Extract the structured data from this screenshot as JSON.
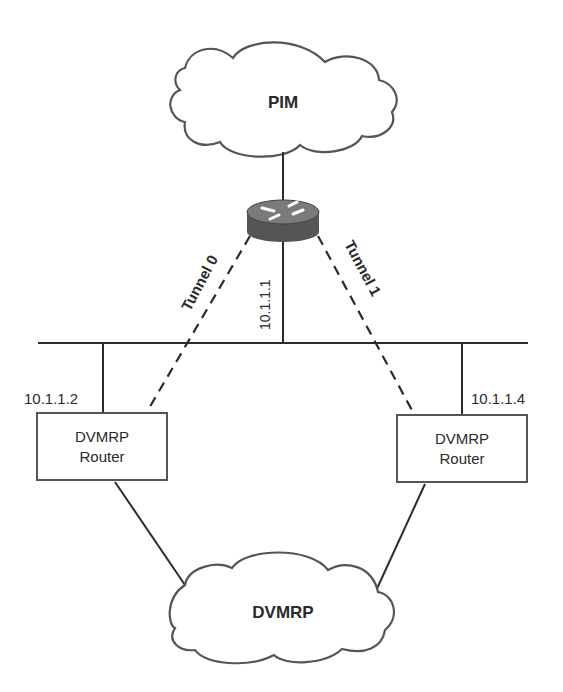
{
  "diagram": {
    "clouds": {
      "top": {
        "label": "PIM"
      },
      "bottom": {
        "label": "DVMRP"
      }
    },
    "central_router": {
      "icon": "router-icon",
      "ip": "10.1.1.1"
    },
    "tunnels": {
      "left": {
        "label": "Tunnel 0"
      },
      "right": {
        "label": "Tunnel 1"
      }
    },
    "routers": {
      "left": {
        "line1": "DVMRP",
        "line2": "Router",
        "ip": "10.1.1.2"
      },
      "right": {
        "line1": "DVMRP",
        "line2": "Router",
        "ip": "10.1.1.4"
      }
    },
    "colors": {
      "stroke": "#2b2b2b",
      "router_body": "#5a5a5a",
      "router_top": "#7a7a7a",
      "cloud_stroke": "#555555"
    }
  }
}
